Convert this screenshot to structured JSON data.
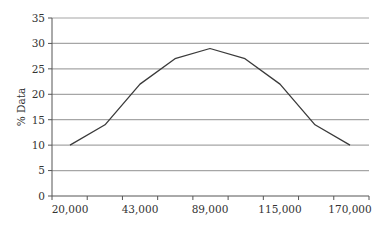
{
  "chart_data": {
    "type": "line",
    "title": "",
    "xlabel": "",
    "ylabel": "% Data",
    "x": [
      "20,000",
      "",
      "43,000",
      "",
      "89,000",
      "",
      "115,000",
      "",
      "170,000"
    ],
    "x_tick_labels": [
      "20,000",
      "43,000",
      "89,000",
      "115,000",
      "170,000"
    ],
    "series": [
      {
        "name": "% Data",
        "values": [
          10,
          14,
          22,
          27,
          29,
          27,
          22,
          14,
          10
        ]
      }
    ],
    "ylim": [
      0,
      35
    ],
    "y_ticks": [
      0,
      5,
      10,
      15,
      20,
      25,
      30,
      35
    ],
    "grid": true,
    "legend": "none"
  },
  "colors": {
    "line": "#3a3a3a",
    "grid": "#a6a6a6",
    "axis": "#555555",
    "text": "#333333"
  }
}
